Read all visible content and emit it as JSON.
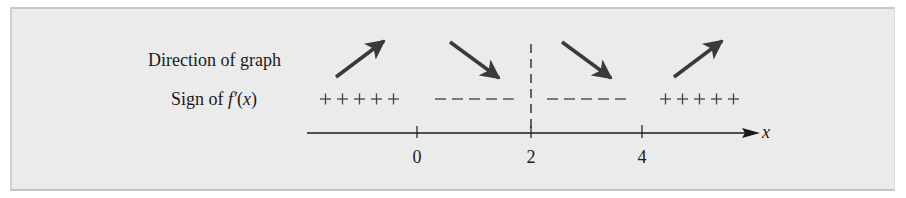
{
  "figure": {
    "row_labels": {
      "direction": "Direction of graph",
      "sign_prefix": "Sign of ",
      "sign_func": "f′",
      "sign_arg_open": "(",
      "sign_arg": "x",
      "sign_arg_close": ")"
    },
    "axis": {
      "variable": "x",
      "ticks": [
        {
          "value": "0"
        },
        {
          "value": "2"
        },
        {
          "value": "4"
        }
      ],
      "critical_dashed_at": "2"
    },
    "intervals": [
      {
        "sign": "+++++",
        "direction": "increasing",
        "arrow": "up-right-arrow"
      },
      {
        "sign": "- - - - -",
        "direction": "decreasing",
        "arrow": "down-right-arrow"
      },
      {
        "sign": "- - - - -",
        "direction": "decreasing",
        "arrow": "down-right-arrow"
      },
      {
        "sign": "+++++",
        "direction": "increasing",
        "arrow": "up-right-arrow"
      }
    ],
    "colors": {
      "panel_background": "#ebebeb",
      "ink": "#1a1a1a",
      "arrow": "#3a3a3a"
    }
  }
}
